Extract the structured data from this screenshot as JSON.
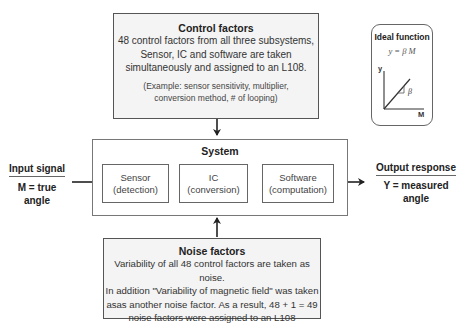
{
  "control_factors": {
    "title": "Control factors",
    "lines": [
      "48 control factors from all three subsystems,",
      "Sensor, IC and software are taken",
      "simultaneously and assigned to an L108."
    ],
    "example_lines": [
      "(Example: sensor sensitivity, multiplier,",
      "conversion method, # of looping)"
    ]
  },
  "ideal_function": {
    "title": "Ideal function",
    "equation": "y = β M",
    "y_axis": "y",
    "x_axis": "M",
    "slope_label": "β"
  },
  "system": {
    "title": "System",
    "subsystems": [
      {
        "name": "Sensor",
        "role": "(detection)"
      },
      {
        "name": "IC",
        "role": "(conversion)"
      },
      {
        "name": "Software",
        "role": "(computation)"
      }
    ]
  },
  "input": {
    "heading": "Input signal",
    "value_lines": [
      "M = true",
      "angle"
    ]
  },
  "output": {
    "heading": "Output response",
    "value_lines": [
      "Y = measured",
      "angle"
    ]
  },
  "noise_factors": {
    "title": "Noise factors",
    "lines": [
      "Variability of all 48 control factors are taken as noise.",
      "In addition \"Variability of magnetic field\" was taken",
      "asas another noise factor. As a result, 48 + 1 = 49",
      "noise factors were assigned to an L108"
    ]
  }
}
